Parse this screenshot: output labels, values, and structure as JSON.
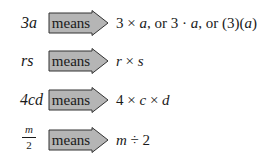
{
  "arrow_label": "means",
  "arrow_color": "#b3b3b3",
  "arrow_border": "#333333",
  "rows": [
    {
      "lhs": "3a",
      "rhs": [
        "3",
        "×",
        "a",
        ", or 3",
        "·",
        "a",
        ", or (3)(",
        "a",
        ")"
      ]
    },
    {
      "lhs": "rs",
      "rhs": [
        "r",
        "×",
        "s"
      ]
    },
    {
      "lhs": "4cd",
      "rhs": [
        "4",
        "×",
        "c",
        "×",
        "d"
      ]
    },
    {
      "lhs_numerator": "m",
      "lhs_denominator": "2",
      "rhs": [
        "m",
        "÷",
        "2"
      ]
    }
  ],
  "row_text": [
    "3a means 3 × a, or 3 · a, or (3)(a)",
    "rs means r × s",
    "4cd means 4 × c × d",
    "m/2 means m ÷ 2"
  ]
}
